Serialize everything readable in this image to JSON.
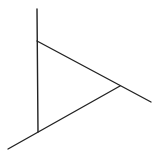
{
  "diagram": {
    "stroke_color": "#222222",
    "background_color": "#ffffff",
    "stroke_width": 1.4,
    "vertices": {
      "A": [
        37,
        41
      ],
      "B": [
        38,
        132
      ],
      "C": [
        120,
        86
      ]
    },
    "lines": [
      {
        "id": "vertical-line",
        "from": [
          37,
          9
        ],
        "to": [
          38,
          132
        ]
      },
      {
        "id": "upper-diagonal",
        "from": [
          37,
          41
        ],
        "to": [
          151,
          102
        ]
      },
      {
        "id": "lower-diagonal",
        "from": [
          8,
          149
        ],
        "to": [
          120,
          86
        ]
      }
    ]
  }
}
